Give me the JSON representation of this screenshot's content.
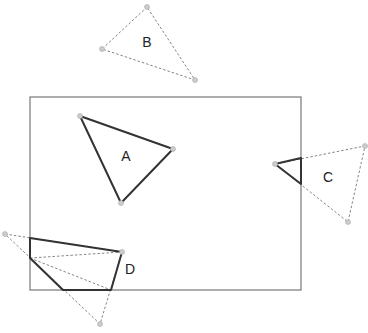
{
  "clip_window": {
    "x": 30,
    "y": 97,
    "width": 271,
    "height": 193,
    "stroke": "#777777"
  },
  "colors": {
    "solid": "#333333",
    "dashed": "#777777",
    "vertex_fill": "#cccccc",
    "vertex_stroke": "#aaaaaa"
  },
  "polygons": [
    {
      "label": "A",
      "label_pos": [
        126,
        161
      ],
      "original": [
        [
          80,
          116
        ],
        [
          173,
          149
        ],
        [
          121,
          203
        ]
      ],
      "clipped": [
        [
          80,
          116
        ],
        [
          173,
          149
        ],
        [
          121,
          203
        ]
      ]
    },
    {
      "label": "B",
      "label_pos": [
        147,
        47
      ],
      "original": [
        [
          147,
          7
        ],
        [
          102,
          49
        ],
        [
          195,
          80
        ]
      ],
      "clipped": []
    },
    {
      "label": "C",
      "label_pos": [
        328,
        182
      ],
      "original": [
        [
          275,
          164
        ],
        [
          365,
          146
        ],
        [
          348,
          222
        ]
      ],
      "clipped": [
        [
          275,
          164
        ],
        [
          301,
          158
        ],
        [
          301,
          184
        ]
      ]
    },
    {
      "label": "D",
      "label_pos": [
        130,
        274
      ],
      "original": [
        [
          5,
          234
        ],
        [
          122,
          252
        ],
        [
          100,
          324
        ]
      ],
      "clipped": [
        [
          30,
          238
        ],
        [
          122,
          252
        ],
        [
          111,
          290
        ],
        [
          63,
          290
        ],
        [
          30,
          258
        ]
      ]
    }
  ]
}
